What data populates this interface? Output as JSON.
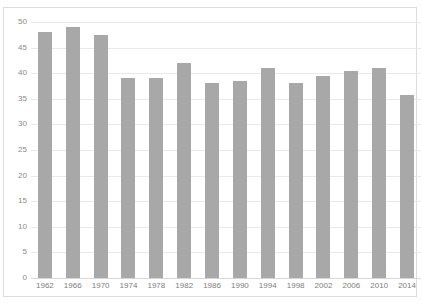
{
  "chart_data": {
    "type": "bar",
    "title": "",
    "xlabel": "",
    "ylabel": "",
    "categories": [
      "1962",
      "1966",
      "1970",
      "1974",
      "1978",
      "1982",
      "1986",
      "1990",
      "1994",
      "1998",
      "2002",
      "2006",
      "2010",
      "2014"
    ],
    "values": [
      48,
      49,
      47.5,
      39,
      39,
      42,
      38,
      38.5,
      41,
      38,
      39.5,
      40.5,
      41,
      35.7
    ],
    "ylim": [
      0,
      50
    ],
    "ytick_step": 5,
    "yticks": [
      "50",
      "45",
      "40",
      "35",
      "30",
      "25",
      "20",
      "15",
      "10",
      "5",
      "0"
    ],
    "grid": true,
    "legend": "none",
    "bar_color": "#a8a8a8",
    "gridline_color": "#e9e9e9",
    "frame_color": "#dcdcdc"
  },
  "title_remnant": ""
}
